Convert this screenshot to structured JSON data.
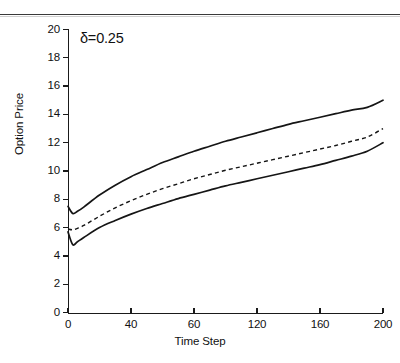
{
  "figure": {
    "annotation": "δ=0.25",
    "rule_present": true
  },
  "axes": {
    "x_title": "Time Step",
    "y_title": "Option Price",
    "x_ticks": [
      "0",
      "40",
      "60",
      "120",
      "160",
      "200"
    ],
    "y_ticks": [
      "20",
      "18",
      "16",
      "14",
      "12",
      "10",
      "8",
      "6",
      "4",
      "2",
      "0"
    ]
  },
  "chart_data": {
    "type": "line",
    "title": "",
    "subtitle": "",
    "annotation": "δ=0.25",
    "xlabel": "Time Step",
    "ylabel": "Option Price",
    "xlim": [
      0,
      200
    ],
    "ylim": [
      0,
      20
    ],
    "xticks": [
      0,
      40,
      80,
      120,
      160,
      200
    ],
    "xticklabels": [
      "0",
      "40",
      "60",
      "120",
      "160",
      "200"
    ],
    "yticks": [
      0,
      2,
      4,
      6,
      8,
      10,
      12,
      14,
      16,
      18,
      20
    ],
    "grid": false,
    "legend": "none",
    "x": [
      0,
      3,
      6,
      10,
      20,
      30,
      40,
      50,
      60,
      70,
      80,
      90,
      100,
      110,
      120,
      130,
      140,
      150,
      160,
      170,
      180,
      190,
      200
    ],
    "series": [
      {
        "name": "upper-bound",
        "style": "solid",
        "color": "#151515",
        "values": [
          7.5,
          7.0,
          7.15,
          7.45,
          8.3,
          9.0,
          9.6,
          10.1,
          10.6,
          11.0,
          11.4,
          11.75,
          12.1,
          12.4,
          12.7,
          13.0,
          13.3,
          13.55,
          13.8,
          14.05,
          14.3,
          14.5,
          15.0
        ]
      },
      {
        "name": "mean-estimate",
        "style": "dashed",
        "color": "#151515",
        "values": [
          5.9,
          5.85,
          5.95,
          6.15,
          6.8,
          7.4,
          7.9,
          8.35,
          8.75,
          9.1,
          9.45,
          9.75,
          10.05,
          10.3,
          10.55,
          10.8,
          11.05,
          11.3,
          11.55,
          11.8,
          12.1,
          12.4,
          13.0
        ]
      },
      {
        "name": "lower-bound",
        "style": "solid",
        "color": "#151515",
        "values": [
          5.7,
          4.8,
          5.0,
          5.3,
          6.0,
          6.5,
          6.95,
          7.35,
          7.7,
          8.05,
          8.35,
          8.65,
          8.95,
          9.2,
          9.45,
          9.7,
          9.95,
          10.2,
          10.45,
          10.75,
          11.05,
          11.4,
          12.0
        ]
      }
    ]
  }
}
